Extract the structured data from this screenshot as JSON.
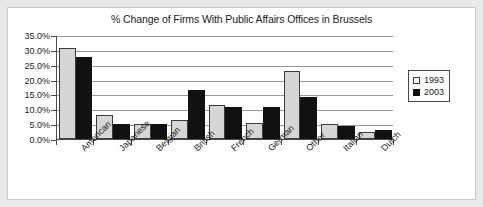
{
  "chart_data": {
    "type": "bar",
    "title": "% Change of Firms With Public Affairs Offices in Brussels",
    "xlabel": "",
    "ylabel": "",
    "categories": [
      "American",
      "Japanese",
      "Belgian",
      "British",
      "French",
      "German",
      "Other",
      "Italian",
      "Dutch"
    ],
    "series": [
      {
        "name": "1993",
        "color": "#d6d6d6",
        "values": [
          30.7,
          8.0,
          5.2,
          6.4,
          11.5,
          5.4,
          23.0,
          4.9,
          2.4
        ]
      },
      {
        "name": "2003",
        "color": "#111111",
        "values": [
          27.5,
          5.2,
          5.2,
          16.4,
          10.8,
          10.8,
          14.2,
          4.5,
          3.1
        ]
      }
    ],
    "ylim": [
      0,
      35
    ],
    "ytick_values": [
      0,
      5,
      10,
      15,
      20,
      25,
      30,
      35
    ],
    "ytick_labels": [
      "0.0%",
      "5.0%",
      "10.0%",
      "15.0%",
      "20.0%",
      "25.0%",
      "30.0%",
      "35.0%"
    ],
    "grid": true,
    "legend_position": "right"
  },
  "legend": {
    "entries": [
      {
        "label": "1993"
      },
      {
        "label": "2003"
      }
    ]
  }
}
